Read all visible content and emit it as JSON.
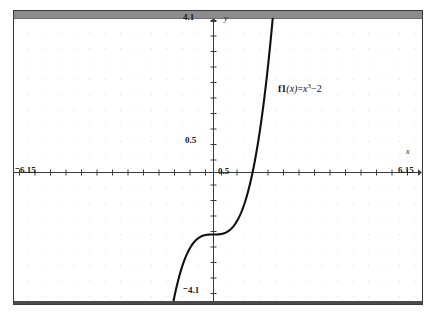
{
  "window": {
    "titlebar_color": "#8c8c8c",
    "frame_color": "#3a3a3a",
    "background": "#ffffff"
  },
  "axes": {
    "x_name": "x",
    "y_name": "y",
    "x_min_label": "⁻6.15",
    "x_max_label": "6.15",
    "x_tick_label": "0.5",
    "y_min_label": "⁻4.1",
    "y_max_label": "4.1",
    "y_tick_label": "0.5"
  },
  "annotation": {
    "function_name": "f1",
    "arg": "(x)",
    "equals": "=",
    "base": "x",
    "exponent": "3",
    "constant": "−2",
    "full_text": "f1(x)=x³−2"
  },
  "chart_data": {
    "type": "line",
    "title": "",
    "subtitle": "",
    "xlabel": "x",
    "ylabel": "y",
    "xlim": [
      -6.15,
      6.15
    ],
    "ylim": [
      -4.1,
      4.1
    ],
    "grid": true,
    "grid_style": "dots",
    "grid_spacing": 0.5,
    "tick_spacing": 0.5,
    "legend": "none",
    "annotations": [
      {
        "text": "f1(x)=x³−2",
        "x": 1.9,
        "y": 2.3
      }
    ],
    "series": [
      {
        "name": "f1(x)=x³−2",
        "color": "#111111",
        "equation": "y = x^3 - 2",
        "x": [
          -1.0,
          -0.9,
          -0.8,
          -0.7,
          -0.6,
          -0.5,
          -0.4,
          -0.3,
          -0.2,
          -0.1,
          0.0,
          0.1,
          0.2,
          0.3,
          0.4,
          0.5,
          0.6,
          0.7,
          0.8,
          0.9,
          1.0,
          1.1,
          1.2,
          1.3,
          1.4,
          1.5,
          1.6,
          1.7,
          1.8
        ],
        "values": [
          -3.0,
          -2.729,
          -2.512,
          -2.343,
          -2.216,
          -2.125,
          -2.064,
          -2.027,
          -2.008,
          -2.001,
          -2.0,
          -1.999,
          -1.992,
          -1.973,
          -1.936,
          -1.875,
          -1.784,
          -1.657,
          -1.488,
          -1.271,
          -1.0,
          -0.669,
          -0.272,
          0.197,
          0.744,
          1.375,
          2.096,
          2.913,
          3.832
        ],
        "roots": [
          1.26
        ],
        "y_intercept": -2.0,
        "inflection": {
          "x": 0.0,
          "y": -2.0
        }
      }
    ]
  }
}
